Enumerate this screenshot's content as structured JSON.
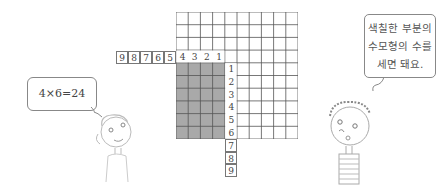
{
  "figure": {
    "type": "multiplication-grid-model",
    "grid": {
      "rows": 10,
      "cols": 10,
      "shaded_cols": 4,
      "shaded_rows": 6,
      "shade_color": "#a9a9a9",
      "line_color": "#555555"
    },
    "horizontal_labels": [
      "9",
      "8",
      "7",
      "6",
      "5",
      "4",
      "3",
      "2",
      "1"
    ],
    "vertical_labels": [
      "1",
      "2",
      "3",
      "4",
      "5",
      "6",
      "7",
      "8",
      "9"
    ]
  },
  "left_character": {
    "speech": "4×6=24"
  },
  "right_character": {
    "speech_lines": [
      "색칠한 부분의",
      "수모형의 수를",
      "세면 돼요."
    ]
  }
}
